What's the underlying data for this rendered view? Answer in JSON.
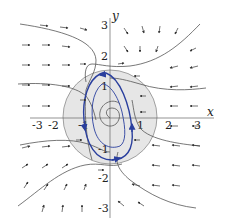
{
  "figure": {
    "type": "phase-portrait",
    "axes": {
      "x_label": "x",
      "y_label": "y",
      "x_ticks": [
        "-3",
        "-2",
        "-1",
        "1",
        "2",
        "3"
      ],
      "y_ticks": [
        "3",
        "2",
        "1",
        "-1",
        "-2",
        "-3"
      ]
    },
    "colors": {
      "disc_fill": "#e6e6e6",
      "disc_stroke": "#8c8c8c",
      "trajectory": "#555555",
      "limit_cycle": "#2a3f9e",
      "arrow": "#333333"
    },
    "region": "disc of radius 2 centered at origin",
    "limit_cycle": "clockwise-oriented closed orbit tilted ellipse",
    "equilibrium": "spiral at origin"
  }
}
